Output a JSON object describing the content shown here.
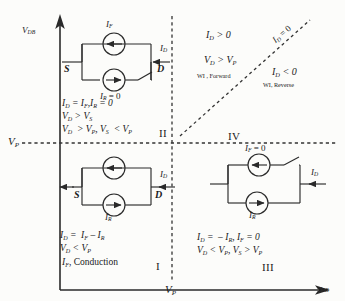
{
  "figure": {
    "type": "quadrant-operating-region-diagram",
    "axes": {
      "y_label": "V",
      "y_label_sub": "DB",
      "x_label": "v",
      "x_label_sub": "SB",
      "y_threshold_label": "V",
      "y_threshold_sub": "P",
      "x_threshold_label": "V",
      "x_threshold_sub": "P"
    },
    "quadrants": {
      "two": {
        "roman": "II",
        "circuit": {
          "source_terminal": "S",
          "drain_terminal": "D",
          "top_source_label": "I",
          "top_source_sub": "F",
          "bottom_source_label": "I",
          "bottom_source_sub": "R",
          "bottom_source_value": " = 0",
          "drain_current_label": "I",
          "drain_current_sub": "D",
          "switch_state": "open"
        },
        "equations": [
          {
            "parts": [
              {
                "t": "I",
                "s": "D"
              },
              {
                "t": " = "
              },
              {
                "t": "I",
                "s": "F"
              },
              {
                "t": ", "
              },
              {
                "t": "I",
                "s": "R"
              },
              {
                "t": " = 0"
              }
            ]
          },
          {
            "parts": [
              {
                "t": "V",
                "s": "D"
              },
              {
                "t": " > "
              },
              {
                "t": "V",
                "s": "S"
              }
            ]
          },
          {
            "parts": [
              {
                "t": "V",
                "s": "D"
              },
              {
                "t": " > "
              },
              {
                "t": "V",
                "s": "P"
              },
              {
                "t": ", "
              },
              {
                "t": "V",
                "s": "S"
              },
              {
                "t": " < "
              },
              {
                "t": "V",
                "s": "P"
              }
            ]
          }
        ]
      },
      "one": {
        "roman": "I",
        "circuit": {
          "source_terminal": "S",
          "drain_terminal": "D",
          "top_source_label": "I",
          "top_source_sub": "F",
          "bottom_source_label": "I",
          "bottom_source_sub": "R",
          "drain_current_label": "I",
          "drain_current_sub": "D",
          "switch_state": "closed"
        },
        "equations": [
          {
            "parts": [
              {
                "t": "I",
                "s": "D"
              },
              {
                "t": " = "
              },
              {
                "t": "I",
                "s": "F"
              },
              {
                "t": " – "
              },
              {
                "t": "I",
                "s": "R"
              }
            ]
          },
          {
            "parts": [
              {
                "t": "V",
                "s": "D"
              },
              {
                "t": " < "
              },
              {
                "t": "V",
                "s": "P"
              }
            ]
          },
          {
            "parts": [
              {
                "t": "I",
                "s": "F"
              },
              {
                "t": ", Conduction",
                "n": true
              }
            ]
          }
        ]
      },
      "three": {
        "roman": "III",
        "circuit": {
          "top_source_label": "I",
          "top_source_sub": "F",
          "top_source_value": " = 0",
          "bottom_source_label": "I",
          "bottom_source_sub": "R",
          "drain_current_label": "I",
          "drain_current_sub": "D",
          "switch_state": "open"
        },
        "equations": [
          {
            "parts": [
              {
                "t": "I",
                "s": "D"
              },
              {
                "t": " =  – "
              },
              {
                "t": "I",
                "s": "R"
              },
              {
                "t": ", "
              },
              {
                "t": "I",
                "s": "F"
              },
              {
                "t": " = 0"
              }
            ]
          },
          {
            "parts": [
              {
                "t": "V",
                "s": "D"
              },
              {
                "t": " < "
              },
              {
                "t": "V",
                "s": "P"
              },
              {
                "t": ", "
              },
              {
                "t": "V",
                "s": "S"
              },
              {
                "t": " > "
              },
              {
                "t": "V",
                "s": "P"
              }
            ]
          }
        ]
      },
      "four": {
        "roman": "IV"
      }
    },
    "region_annotations": {
      "forward": {
        "line1": [
          {
            "t": "I",
            "s": "D"
          },
          {
            "t": " > 0"
          }
        ],
        "line2": [
          {
            "t": "V",
            "s": "D"
          },
          {
            "t": " > "
          },
          {
            "t": "V",
            "s": "P"
          }
        ],
        "caption": "WI , Forward"
      },
      "reverse": {
        "line1": [
          {
            "t": "I",
            "s": "D"
          },
          {
            "t": " < 0"
          }
        ],
        "caption": "WI, Reverse"
      },
      "diagonal": {
        "label": [
          {
            "t": "I",
            "s": "D"
          },
          {
            "t": " = 0"
          }
        ]
      }
    },
    "colors": {
      "line": "#2a2a2a",
      "dashed": "#333333",
      "background": "#fcfcfa"
    }
  }
}
